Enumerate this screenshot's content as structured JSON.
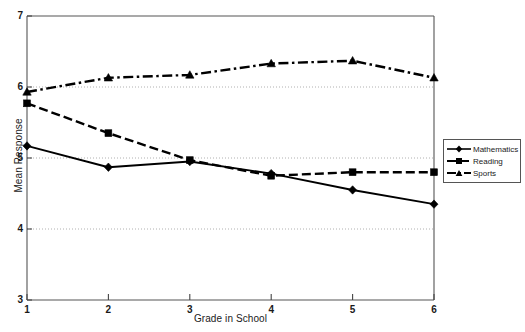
{
  "chart_data": {
    "type": "line",
    "title": "",
    "xlabel": "Grade in School",
    "ylabel": "Mean Response",
    "x": [
      1,
      2,
      3,
      4,
      5,
      6
    ],
    "xticklabels": [
      "1",
      "2",
      "3",
      "4",
      "5",
      "6"
    ],
    "yticklabels": [
      "3",
      "4",
      "5",
      "6",
      "7"
    ],
    "yticks": [
      3,
      4,
      5,
      6,
      7
    ],
    "xlim": [
      1,
      6
    ],
    "ylim": [
      3,
      7
    ],
    "grid": "horizontal-dotted",
    "legend_position": "right-outside",
    "series": [
      {
        "name": "Mathematics",
        "marker": "diamond",
        "linestyle": "solid",
        "color": "#000000",
        "values": [
          5.17,
          4.87,
          4.95,
          4.78,
          4.55,
          4.35
        ]
      },
      {
        "name": "Reading",
        "marker": "square",
        "linestyle": "dashed",
        "color": "#000000",
        "values": [
          5.77,
          5.35,
          4.97,
          4.75,
          4.8,
          4.8
        ]
      },
      {
        "name": "Sports",
        "marker": "triangle",
        "linestyle": "dash-dot",
        "color": "#000000",
        "values": [
          5.93,
          6.13,
          6.17,
          6.33,
          6.37,
          6.13
        ]
      }
    ]
  },
  "axis": {
    "ylabel": "Mean Response",
    "xlabel": "Grade in School",
    "ytick_0": "3",
    "ytick_1": "4",
    "ytick_2": "5",
    "ytick_3": "6",
    "ytick_4": "7",
    "xtick_0": "1",
    "xtick_1": "2",
    "xtick_2": "3",
    "xtick_3": "4",
    "xtick_4": "5",
    "xtick_5": "6"
  },
  "legend": {
    "items": [
      {
        "label": "Mathematics"
      },
      {
        "label": "Reading"
      },
      {
        "label": "Sports"
      }
    ]
  },
  "colors": {
    "line": "#000000",
    "axis": "#4a4a4a",
    "grid": "#b8b8b8",
    "background": "#ffffff"
  }
}
